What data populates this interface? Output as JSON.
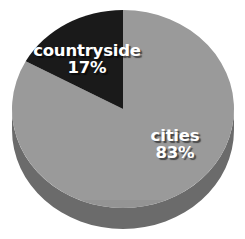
{
  "chart_data": {
    "type": "pie",
    "title": "",
    "subtitle": "",
    "xlabel": "",
    "ylabel": "",
    "grid": false,
    "legend_position": "none",
    "style": "3d-pie",
    "start_angle_deg": 0,
    "direction": "counterclockwise",
    "units": "percent",
    "total": 100,
    "categories": [
      "cities",
      "countryside"
    ],
    "values": [
      83,
      17
    ],
    "slices": [
      {
        "label": "cities",
        "value": 83,
        "value_text": "83%",
        "color": "#9a9a9a",
        "side_color": "#6b6b6b",
        "label_color": "#ffffff"
      },
      {
        "label": "countryside",
        "value": 17,
        "value_text": "17%",
        "color": "#1a1a1a",
        "side_color": "#111111",
        "label_color": "#ffffff"
      }
    ],
    "annotations": []
  },
  "labels": {
    "countryside": {
      "name": "countryside",
      "value": "17%"
    },
    "cities": {
      "name": "cities",
      "value": "83%"
    }
  },
  "colors": {
    "background": "#ffffff",
    "slice_cities": "#9a9a9a",
    "slice_countryside": "#1a1a1a",
    "side_wall": "#6b6b6b",
    "label_text": "#ffffff"
  }
}
